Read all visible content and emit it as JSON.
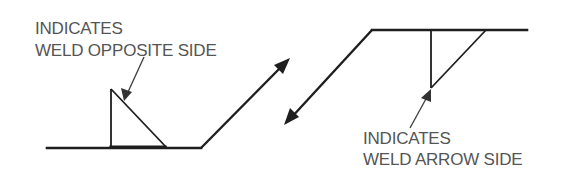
{
  "figure": {
    "colors": {
      "line": "#1e1e1e",
      "text": "#555555",
      "background": "#ffffff"
    },
    "left_symbol": {
      "label_line1": "INDICATES",
      "label_line2": "WELD OPPOSITE SIDE",
      "symbol": "fillet-weld-triangle-above-reference-line",
      "meaning": "weld on opposite side"
    },
    "right_symbol": {
      "label_line1": "INDICATES",
      "label_line2": "WELD ARROW SIDE",
      "symbol": "fillet-weld-triangle-below-reference-line",
      "meaning": "weld on arrow side"
    }
  }
}
